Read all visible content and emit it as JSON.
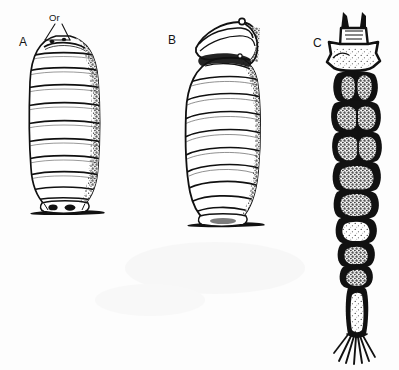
{
  "figure": {
    "style": "black and white stippled line drawing",
    "background_color": "#fdfdfd",
    "ink_color": "#111111",
    "panels": [
      {
        "id": "A",
        "label": "A",
        "caption_text": "A",
        "description": "Barrel-shaped puparium, lateral-ventral view, standing on a substrate line",
        "segment_bands": 10,
        "shading": "stipple on right flank",
        "annotations": [
          {
            "id": "Or",
            "label": "Or",
            "leader": "triangular leader lines to anterior end",
            "target": "anterior spiracular region"
          }
        ]
      },
      {
        "id": "B",
        "label": "B",
        "caption_text": "B",
        "description": "Puparium with anterior cap tilted open, lateral view, on a substrate line",
        "segment_bands": 9,
        "shading": "stipple on right flank",
        "annotations": []
      },
      {
        "id": "C",
        "label": "C",
        "caption_text": "C",
        "description": "Elongate beaded larva, dorsal view, head capsule with horn projections and terminal caudal bristles",
        "body_segments": 9,
        "head_horns": 2,
        "caudal_bristles": 7,
        "shading": "heavy black outlines with stippled pale segment centres",
        "annotations": []
      }
    ]
  },
  "labels": {
    "panel_a": "A",
    "panel_b": "B",
    "panel_c": "C",
    "annotation_or": "Or"
  }
}
